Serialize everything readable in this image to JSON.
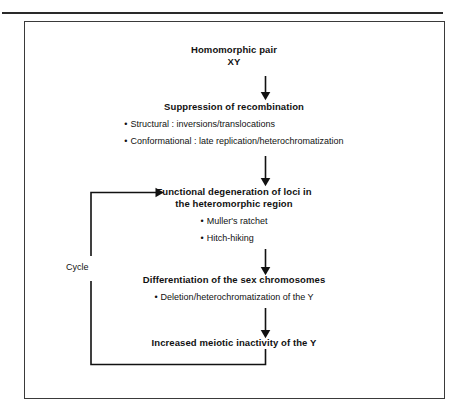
{
  "figure": {
    "type": "flowchart",
    "orientation": "top-to-bottom with feedback loop",
    "nodes": [
      {
        "id": "homomorphic",
        "title_lines": [
          "Homomorphic pair",
          "XY"
        ],
        "bullets": []
      },
      {
        "id": "suppression",
        "title_lines": [
          "Suppression of recombination"
        ],
        "bullets": [
          "Structural : inversions/translocations",
          "Conformational : late replication/heterochromatization"
        ]
      },
      {
        "id": "functional",
        "title_lines": [
          "Functional degeneration of loci in",
          "the heteromorphic region"
        ],
        "bullets": [
          "Muller's ratchet",
          "Hitch-hiking"
        ]
      },
      {
        "id": "differentiation",
        "title_lines": [
          "Differentiation of the sex chromosomes"
        ],
        "bullets": [
          "Deletion/heterochromatization of the Y"
        ]
      },
      {
        "id": "increased",
        "title_lines": [
          "Increased meiotic inactivity of the Y"
        ],
        "bullets": []
      }
    ],
    "feedback_label": "Cycle",
    "bullet_glyph": "•",
    "colors": {
      "ink": "#111111",
      "rule": "#2a2a2a",
      "frame": "#3a3a3a",
      "background": "#ffffff"
    }
  }
}
